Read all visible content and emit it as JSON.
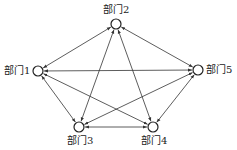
{
  "diagram": {
    "type": "directed-graph",
    "nodes": [
      {
        "id": "n1",
        "label": "部门1",
        "x": 38,
        "y": 71
      },
      {
        "id": "n2",
        "label": "部门2",
        "x": 116,
        "y": 24
      },
      {
        "id": "n3",
        "label": "部门3",
        "x": 79,
        "y": 127
      },
      {
        "id": "n4",
        "label": "部门4",
        "x": 153,
        "y": 127
      },
      {
        "id": "n5",
        "label": "部门5",
        "x": 198,
        "y": 70
      }
    ],
    "edges": [
      {
        "from": "n1",
        "to": "n2",
        "bidirectional": true
      },
      {
        "from": "n1",
        "to": "n3",
        "bidirectional": true
      },
      {
        "from": "n1",
        "to": "n4",
        "bidirectional": true
      },
      {
        "from": "n1",
        "to": "n5",
        "bidirectional": true
      },
      {
        "from": "n2",
        "to": "n3",
        "bidirectional": true
      },
      {
        "from": "n2",
        "to": "n4",
        "bidirectional": true
      },
      {
        "from": "n2",
        "to": "n5",
        "bidirectional": true
      },
      {
        "from": "n3",
        "to": "n4",
        "bidirectional": true
      },
      {
        "from": "n3",
        "to": "n5",
        "bidirectional": true
      },
      {
        "from": "n4",
        "to": "n5",
        "bidirectional": true
      }
    ],
    "colors": {
      "line": "#333333",
      "node_stroke": "#222222",
      "node_fill": "#ffffff"
    }
  }
}
